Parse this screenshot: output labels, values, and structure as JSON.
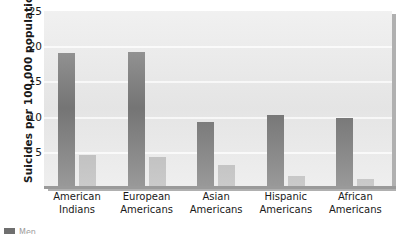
{
  "chart_data": {
    "type": "bar",
    "title": "",
    "xlabel": "",
    "ylabel": "Suicides per 100,000 population",
    "ylim": [
      0,
      25
    ],
    "yticks": [
      25,
      20,
      15,
      10,
      5
    ],
    "grid": true,
    "legend_position": "bottom-left",
    "categories": [
      "American Indians",
      "European Americans",
      "Asian Americans",
      "Hispanic Americans",
      "African Americans"
    ],
    "category_lines": [
      [
        "American",
        "Indians"
      ],
      [
        "European",
        "Americans"
      ],
      [
        "Asian",
        "Americans"
      ],
      [
        "Hispanic",
        "Americans"
      ],
      [
        "African",
        "Americans"
      ]
    ],
    "series": [
      {
        "name": "Men",
        "color": "#777777",
        "values": [
          19.0,
          19.2,
          9.3,
          10.2,
          9.8
        ]
      },
      {
        "name": "Women",
        "color": "#b9b9b9",
        "values": [
          4.6,
          4.2,
          3.1,
          1.6,
          1.2
        ]
      }
    ]
  },
  "legend": {
    "swatch_color": "#6f6f6f",
    "label": "Men"
  },
  "colors": {
    "plot_background": "#e9e9e9",
    "gridline": "#fbfbfb",
    "axis": "#9a9a9a",
    "text": "#1a1a1a"
  }
}
